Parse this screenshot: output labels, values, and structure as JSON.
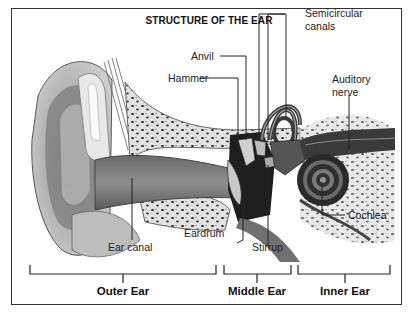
{
  "diagram": {
    "title": "STRUCTURE OF THE EAR",
    "labels": {
      "anvil": "Anvil",
      "hammer": "Hammer",
      "semicircular_line1": "Semicircular",
      "semicircular_line2": "canals",
      "auditory_line1": "Auditory",
      "auditory_line2": "nerve",
      "cochlea": "Cochlea",
      "ear_canal": "Ear canal",
      "eardrum": "Eardrum",
      "stirrup": "Stirrup"
    },
    "sections": [
      {
        "label": "Outer Ear"
      },
      {
        "label": "Middle Ear"
      },
      {
        "label": "Inner Ear"
      }
    ],
    "colors": {
      "ink": "#222222",
      "bone": "#d8d8d8",
      "tissue": "#9a9a9a",
      "shadow": "#4a4a4a"
    }
  }
}
